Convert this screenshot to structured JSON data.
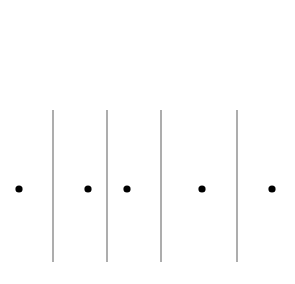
{
  "diagram": {
    "background": "#ffffff",
    "line_color": "#8a8a8a",
    "dot_color": "#000000",
    "dot_radius": 3.6,
    "line_width": 1.4,
    "line_top": 110,
    "line_bottom": 262,
    "dot_y": 189,
    "lines_x": [
      53,
      107,
      161,
      237
    ],
    "dots_x": [
      19,
      88,
      127,
      202,
      272
    ]
  }
}
